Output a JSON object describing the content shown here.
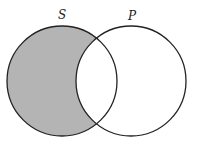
{
  "diagram": {
    "type": "venn",
    "sets": [
      {
        "label": "S",
        "cx": 62,
        "cy": 81,
        "r": 55
      },
      {
        "label": "P",
        "cx": 131,
        "cy": 81,
        "r": 55
      }
    ],
    "shaded_region": "S only (S minus P)",
    "colors": {
      "shade": "#b4b4b4",
      "stroke": "#222222",
      "background": "#ffffff"
    }
  }
}
